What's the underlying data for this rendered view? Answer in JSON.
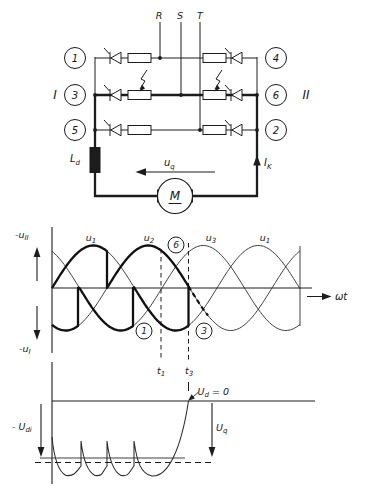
{
  "colors": {
    "ink": "#1c1c1c",
    "bg": "#ffffff"
  },
  "figure": {
    "circuit": {
      "phase_labels": [
        "R",
        "S",
        "T"
      ],
      "group_left_label": "I",
      "group_right_label": "II",
      "thyristor_numbers_left": [
        "1",
        "3",
        "5"
      ],
      "thyristor_numbers_right": [
        "4",
        "6",
        "2"
      ],
      "inductor_label": {
        "base": "L",
        "sub": "d"
      },
      "emf_label": {
        "base": "u",
        "sub": "q"
      },
      "current_label": {
        "base": "I",
        "sub": "K"
      },
      "motor_label": "M"
    },
    "wave_plot": {
      "upper_axis_label": {
        "base": "-u",
        "sub": "II"
      },
      "lower_axis_label": {
        "base": "-u",
        "sub": "I"
      },
      "x_axis_label": "ωt",
      "phase_labels": [
        {
          "base": "u",
          "sub": "1"
        },
        {
          "base": "u",
          "sub": "2"
        },
        {
          "base": "u",
          "sub": "3"
        },
        {
          "base": "u",
          "sub": "1"
        }
      ],
      "marker_labels": [
        "6",
        "1",
        "3"
      ],
      "time_labels": [
        {
          "base": "t",
          "sub": "1"
        },
        {
          "base": "t",
          "sub": "3"
        }
      ]
    },
    "dc_plot": {
      "level_label": {
        "base": "- U",
        "sub": "di"
      },
      "emf_label": {
        "base": "U",
        "sub": "q"
      },
      "zero_label": {
        "base": "U",
        "sub": "d",
        "rest": " = 0"
      }
    }
  },
  "chart_data": [
    {
      "type": "line",
      "title": "Three-phase voltages u1,u2,u3 with bold converter trace (inverter operation, commutation failure at t1, Ud collapse at t3)",
      "xlabel": "ωt",
      "geometry": {
        "x_start": 52,
        "x_end": 300,
        "zero_y": 288,
        "amplitude": 42.5,
        "period_px": 165
      },
      "sines": [
        {
          "name": "u1",
          "rise_x": 52
        },
        {
          "name": "u2",
          "rise_x": 107
        },
        {
          "name": "u3",
          "rise_x": 162
        }
      ],
      "traces": [
        {
          "id": "upper-bold",
          "follow": [
            [
              "u1",
              52,
              107
            ],
            [
              "u2",
              107,
              188.5
            ]
          ],
          "end_jump": true,
          "dashed": false
        },
        {
          "id": "lower-bold",
          "follow": [
            [
              "u2",
              52,
              78
            ],
            [
              "u3",
              79.5,
              133
            ],
            [
              "u1",
              134,
              188.5
            ]
          ],
          "end_jump": true,
          "dashed": false
        },
        {
          "id": "failed-commutation",
          "follow": [
            [
              "u2",
              188.5,
              208
            ]
          ],
          "end_jump": false,
          "dashed": true
        }
      ],
      "t_marks": {
        "t1_x": 161,
        "t3_x": 188.5
      },
      "markers": [
        {
          "label": "6",
          "x": 176,
          "y": 245
        },
        {
          "label": "1",
          "x": 144,
          "y": 331
        },
        {
          "label": "3",
          "x": 204,
          "y": 331
        }
      ]
    },
    {
      "type": "line",
      "title": "Rectified output -Udi ripple rising to Ud = 0 at t3, motor EMF level Uq",
      "zero_y": 401,
      "ripple": {
        "tips_x": [
          52,
          81,
          107,
          134
        ],
        "first_tip_y": 437,
        "tip_y": 441,
        "trough_y": 475.5,
        "land_y": 466,
        "collapse": {
          "c1": [
            137,
            462
          ],
          "c2": [
            141,
            474
          ],
          "mid": [
            152,
            476
          ],
          "c3": [
            168,
            477
          ],
          "c4": [
            181,
            450
          ],
          "end": [
            188.5,
            401
          ]
        }
      },
      "levels": {
        "dashed_y": 462.5,
        "solid_y": 458
      }
    }
  ]
}
